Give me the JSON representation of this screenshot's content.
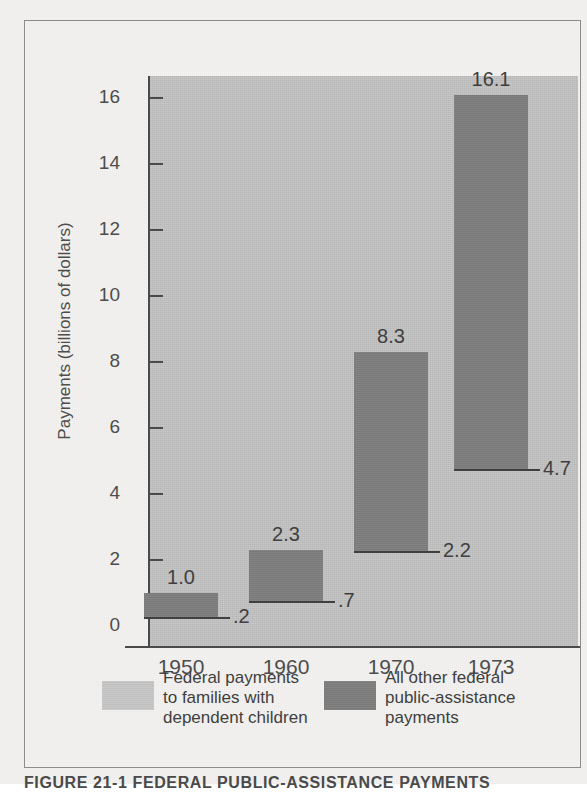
{
  "figure": {
    "caption": "FIGURE  21-1   FEDERAL  PUBLIC-ASSISTANCE  PAYMENTS"
  },
  "axes": {
    "y_title": "Payments (billions of dollars)",
    "y_ticks": [
      "0",
      "2",
      "4",
      "6",
      "8",
      "10",
      "12",
      "14",
      "16"
    ],
    "x_ticks": [
      "1950",
      "1960",
      "1970",
      "1973"
    ]
  },
  "legend": {
    "entries": [
      {
        "label": "Federal payments\nto families with\ndependent children",
        "color": "#c6c6c6",
        "swatch_name": "light-gray"
      },
      {
        "label": "All other federal\npublic-assistance\npayments",
        "color": "#7e7e7e",
        "swatch_name": "dark-gray"
      }
    ]
  },
  "colors": {
    "plot_background": "#c2c2c2",
    "bar_fill": "#7e7e7e",
    "axis": "#4a4a4a",
    "page": "#f3f2f0"
  },
  "chart_data": {
    "type": "bar",
    "title": "FEDERAL PUBLIC-ASSISTANCE PAYMENTS",
    "subtitle": "",
    "xlabel": "",
    "ylabel": "Payments (billions of dollars)",
    "categories": [
      "1950",
      "1960",
      "1970",
      "1973"
    ],
    "ylim": [
      0,
      17.3
    ],
    "yticks": [
      0,
      2,
      4,
      6,
      8,
      10,
      12,
      14,
      16
    ],
    "grid": false,
    "legend_position": "bottom",
    "note": "Floating bars: each bar spans from the AFDC (families with dependent children) value up to the total federal public-assistance payments value. The dark band is 'all other federal public-assistance payments'.",
    "series": [
      {
        "name": "Federal payments to families with dependent children",
        "color": "#c6c6c6",
        "values": [
          0.2,
          0.7,
          2.2,
          4.7
        ],
        "labels": [
          ".2",
          ".7",
          "2.2",
          "4.7"
        ]
      },
      {
        "name": "All other federal public-assistance payments",
        "color": "#7e7e7e",
        "values": [
          0.8,
          1.6,
          6.1,
          11.4
        ],
        "bar_bottom": [
          0.2,
          0.7,
          2.2,
          4.7
        ],
        "bar_top": [
          1.0,
          2.3,
          8.3,
          16.1
        ],
        "top_labels": [
          "1.0",
          "2.3",
          "8.3",
          "16.1"
        ]
      }
    ]
  },
  "bars": [
    {
      "year": "1950",
      "bottom": 0.2,
      "top": 1.0,
      "top_label": "1.0",
      "bottom_label": ".2"
    },
    {
      "year": "1960",
      "bottom": 0.7,
      "top": 2.3,
      "top_label": "2.3",
      "bottom_label": ".7"
    },
    {
      "year": "1970",
      "bottom": 2.2,
      "top": 8.3,
      "top_label": "8.3",
      "bottom_label": "2.2"
    },
    {
      "year": "1973",
      "bottom": 4.7,
      "top": 16.1,
      "top_label": "16.1",
      "bottom_label": "4.7"
    }
  ]
}
